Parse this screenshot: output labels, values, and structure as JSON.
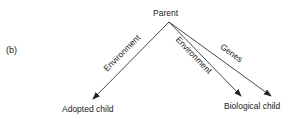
{
  "panel_label": "(b)",
  "nodes": {
    "parent": "Parent",
    "adopted": "Adopted child",
    "biological": "Biological child"
  },
  "edges": [
    {
      "from": "Parent",
      "to": "Adopted child",
      "label": "Environment"
    },
    {
      "from": "Parent",
      "to": "Biological child",
      "label": "Environment"
    },
    {
      "from": "Parent",
      "to": "Biological child",
      "label": "Genes"
    }
  ],
  "colors": {
    "line": "#333333",
    "text": "#222222"
  }
}
